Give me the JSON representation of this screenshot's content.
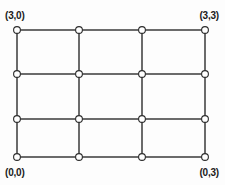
{
  "figure": {
    "background_color": "#fdfdfd",
    "edge_color": "#3a3a3a",
    "node_fill_color": "#ffffff",
    "node_stroke_color": "#2b2b2b",
    "label_color": "#1b1b1b"
  },
  "labels": {
    "top_left": "(3,0)",
    "top_right": "(3,3)",
    "bottom_left": "(0,0)",
    "bottom_right": "(0,3)"
  },
  "chart_data": {
    "type": "scatter",
    "title": "",
    "xlabel": "",
    "ylabel": "",
    "grid": true,
    "legend": "none",
    "rows": 4,
    "cols": 4,
    "cells_rows": 3,
    "cells_cols": 3,
    "column_x": [
      17,
      79,
      142,
      205
    ],
    "row_y": [
      30,
      74,
      119,
      157
    ],
    "node_radius": 3.4,
    "nodes": [
      {
        "row": 0,
        "col": 0,
        "x": 17,
        "y": 30
      },
      {
        "row": 0,
        "col": 1,
        "x": 79,
        "y": 30
      },
      {
        "row": 0,
        "col": 2,
        "x": 142,
        "y": 30
      },
      {
        "row": 0,
        "col": 3,
        "x": 205,
        "y": 30
      },
      {
        "row": 1,
        "col": 0,
        "x": 17,
        "y": 74
      },
      {
        "row": 1,
        "col": 1,
        "x": 79,
        "y": 74
      },
      {
        "row": 1,
        "col": 2,
        "x": 142,
        "y": 74
      },
      {
        "row": 1,
        "col": 3,
        "x": 205,
        "y": 74
      },
      {
        "row": 2,
        "col": 0,
        "x": 17,
        "y": 119
      },
      {
        "row": 2,
        "col": 1,
        "x": 79,
        "y": 119
      },
      {
        "row": 2,
        "col": 2,
        "x": 142,
        "y": 119
      },
      {
        "row": 2,
        "col": 3,
        "x": 205,
        "y": 119
      },
      {
        "row": 3,
        "col": 0,
        "x": 17,
        "y": 157
      },
      {
        "row": 3,
        "col": 1,
        "x": 79,
        "y": 157
      },
      {
        "row": 3,
        "col": 2,
        "x": 142,
        "y": 157
      },
      {
        "row": 3,
        "col": 3,
        "x": 205,
        "y": 157
      }
    ],
    "edges_horizontal": [
      {
        "row": 0,
        "x1": 17,
        "x2": 205,
        "y": 30
      },
      {
        "row": 1,
        "x1": 17,
        "x2": 205,
        "y": 74
      },
      {
        "row": 2,
        "x1": 17,
        "x2": 205,
        "y": 119
      },
      {
        "row": 3,
        "x1": 17,
        "x2": 205,
        "y": 157
      }
    ],
    "edges_vertical": [
      {
        "col": 0,
        "y1": 30,
        "y2": 157,
        "x": 17
      },
      {
        "col": 1,
        "y1": 30,
        "y2": 157,
        "x": 79
      },
      {
        "col": 2,
        "y1": 30,
        "y2": 157,
        "x": 142
      },
      {
        "col": 3,
        "y1": 30,
        "y2": 157,
        "x": 205
      }
    ]
  }
}
